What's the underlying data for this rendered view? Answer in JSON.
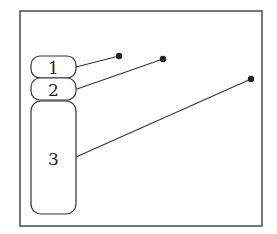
{
  "diagram": {
    "type": "labeled-parts",
    "frame": {
      "x": 20,
      "y": 11,
      "w": 242,
      "h": 215
    },
    "parts": [
      {
        "label": "1",
        "x": 31,
        "y": 56,
        "w": 45,
        "h": 22,
        "rx": 9,
        "leader": {
          "x1": 76,
          "y1": 67,
          "x2": 119,
          "y2": 56
        }
      },
      {
        "label": "2",
        "x": 31,
        "y": 78,
        "w": 45,
        "h": 22,
        "rx": 9,
        "leader": {
          "x1": 77,
          "y1": 89,
          "x2": 163,
          "y2": 59
        }
      },
      {
        "label": "3",
        "x": 31,
        "y": 101,
        "w": 45,
        "h": 113,
        "rx": 10,
        "leader": {
          "x1": 76,
          "y1": 157,
          "x2": 251,
          "y2": 79
        }
      }
    ],
    "colors": {
      "stroke": "#333333",
      "frame": "#555555",
      "dot": "#222222",
      "background": "#ffffff"
    }
  }
}
